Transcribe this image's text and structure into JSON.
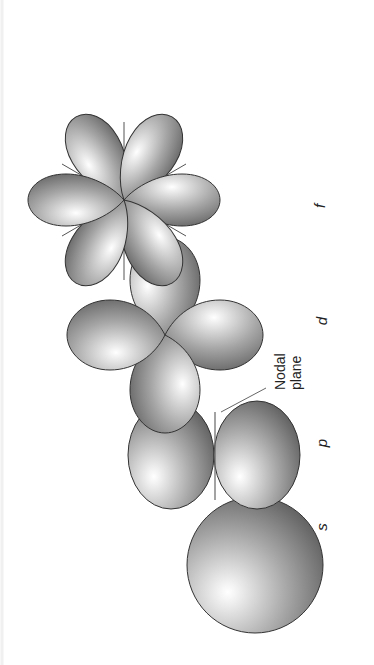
{
  "diagram": {
    "orientation": "rotated 90 degrees counter-clockwise",
    "orbitals": [
      {
        "id": "s",
        "label": "s",
        "lobes": 1
      },
      {
        "id": "p",
        "label": "p",
        "lobes": 2
      },
      {
        "id": "d",
        "label": "d",
        "lobes": 4
      },
      {
        "id": "f",
        "label": "f",
        "lobes": 6
      }
    ],
    "annotation": {
      "line1": "Nodal",
      "line2": "plane"
    }
  },
  "colors": {
    "background": "#ffffff",
    "lobe_dark": "#5a5a5a",
    "lobe_light": "#ffffff",
    "outline": "#333333",
    "axis": "#555555"
  }
}
